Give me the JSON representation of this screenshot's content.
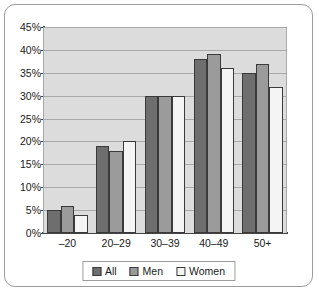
{
  "chart_data": {
    "type": "bar",
    "title": "",
    "subtitle": "",
    "xlabel": "",
    "ylabel": "",
    "categories": [
      "–20",
      "20–29",
      "30–39",
      "40–49",
      "50+"
    ],
    "series": [
      {
        "name": "All",
        "values": [
          5,
          19,
          30,
          38,
          35
        ],
        "color": "#6e6e6e"
      },
      {
        "name": "Men",
        "values": [
          6,
          18,
          30,
          39,
          37
        ],
        "color": "#9b9b9b"
      },
      {
        "name": "Women",
        "values": [
          4,
          20,
          30,
          36,
          32
        ],
        "color": "#f4f4f4"
      }
    ],
    "ylim": [
      0,
      45
    ],
    "ytick_values": [
      0,
      5,
      10,
      15,
      20,
      25,
      30,
      35,
      40,
      45
    ],
    "ytick_labels": [
      "0%",
      "5%",
      "10%",
      "15%",
      "20%",
      "25%",
      "30%",
      "35%",
      "40%",
      "45%"
    ],
    "grid": true,
    "grid_axis": "y",
    "legend_position": "bottom",
    "value_suffix": "%",
    "plot_background": "#dcdcdc",
    "figure_background": "#ffffff",
    "gridline_color": "#a9a9a9",
    "axis_color": "#444444",
    "bar_outline_color": "#3a3a3a",
    "frame_border_color": "#9c9c9c"
  }
}
